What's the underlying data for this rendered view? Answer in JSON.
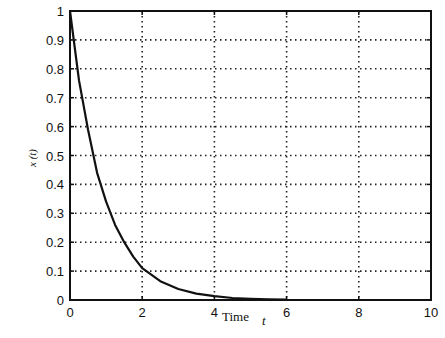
{
  "chart_data": {
    "type": "line",
    "title": "",
    "xlabel": "Time",
    "xlabel_var": "t",
    "ylabel": "x (t)",
    "xlim": [
      0,
      10
    ],
    "ylim": [
      0,
      1
    ],
    "grid": true,
    "grid_style": "dotted",
    "legend": null,
    "x_ticks": [
      "0",
      "2",
      "4",
      "6",
      "8",
      "10"
    ],
    "y_ticks": [
      "0",
      "0.1",
      "0.2",
      "0.3",
      "0.4",
      "0.5",
      "0.6",
      "0.7",
      "0.8",
      "0.9",
      "1"
    ],
    "series": [
      {
        "name": "x(t)",
        "color": "#111111",
        "x": [
          0,
          0.25,
          0.5,
          0.75,
          1.0,
          1.25,
          1.5,
          1.75,
          2.0,
          2.5,
          3.0,
          3.5,
          4.0,
          4.5,
          5.0,
          5.5,
          6.0
        ],
        "y": [
          1.0,
          0.76,
          0.59,
          0.44,
          0.34,
          0.26,
          0.2,
          0.15,
          0.11,
          0.065,
          0.038,
          0.022,
          0.013,
          0.007,
          0.004,
          0.002,
          0.001
        ]
      }
    ]
  }
}
